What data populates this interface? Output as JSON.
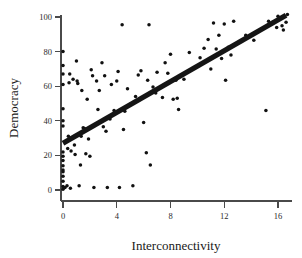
{
  "chart_data": {
    "type": "scatter",
    "title": "",
    "xlabel": "Interconnectivity",
    "ylabel": "Democracy",
    "xlim": [
      -0.8,
      17.2
    ],
    "ylim": [
      -6,
      107
    ],
    "xticks": [
      0,
      4,
      8,
      12,
      16
    ],
    "yticks": [
      0,
      20,
      40,
      60,
      80,
      100
    ],
    "xtick_labels": [
      "0",
      "4",
      "8",
      "12",
      "16"
    ],
    "ytick_labels": [
      "0",
      "20",
      "40",
      "60",
      "80",
      "100"
    ],
    "grid": false,
    "legend": false,
    "point_color": "#111111",
    "line_color": "#151515",
    "axis_color": "#4a4a4a",
    "background": "#ffffff",
    "series": [
      {
        "name": "countries",
        "marker": "filled-circle",
        "points": [
          [
            0.0,
            80.0
          ],
          [
            0.0,
            72.0
          ],
          [
            0.0,
            67.0
          ],
          [
            0.0,
            61.0
          ],
          [
            0.0,
            47.0
          ],
          [
            0.0,
            40.0
          ],
          [
            0.0,
            37.0
          ],
          [
            0.0,
            22.0
          ],
          [
            0.0,
            19.5
          ],
          [
            0.0,
            17.0
          ],
          [
            0.0,
            14.0
          ],
          [
            0.0,
            11.5
          ],
          [
            0.0,
            10.5
          ],
          [
            0.0,
            8.0
          ],
          [
            0.0,
            5.0
          ],
          [
            0.0,
            2.0
          ],
          [
            0.0,
            0.5
          ],
          [
            0.15,
            1.5
          ],
          [
            0.3,
            2.5
          ],
          [
            0.35,
            24.0
          ],
          [
            0.4,
            31.0
          ],
          [
            0.45,
            62.0
          ],
          [
            0.5,
            67.0
          ],
          [
            0.55,
            1.0
          ],
          [
            0.6,
            22.5
          ],
          [
            0.75,
            64.0
          ],
          [
            0.85,
            26.0
          ],
          [
            0.9,
            20.5
          ],
          [
            1.0,
            74.5
          ],
          [
            1.05,
            63.0
          ],
          [
            1.1,
            61.5
          ],
          [
            1.2,
            2.5
          ],
          [
            1.3,
            14.5
          ],
          [
            1.35,
            31.0
          ],
          [
            1.4,
            57.5
          ],
          [
            1.5,
            36.0
          ],
          [
            1.6,
            35.5
          ],
          [
            1.7,
            21.0
          ],
          [
            1.8,
            52.5
          ],
          [
            1.9,
            29.5
          ],
          [
            2.0,
            19.5
          ],
          [
            2.1,
            69.5
          ],
          [
            2.2,
            66.0
          ],
          [
            2.3,
            1.5
          ],
          [
            2.5,
            63.0
          ],
          [
            2.6,
            46.5
          ],
          [
            2.7,
            57.5
          ],
          [
            2.9,
            73.5
          ],
          [
            3.0,
            36.5
          ],
          [
            3.1,
            66.0
          ],
          [
            3.2,
            34.0
          ],
          [
            3.3,
            1.5
          ],
          [
            3.5,
            41.0
          ],
          [
            3.6,
            61.0
          ],
          [
            3.8,
            46.0
          ],
          [
            4.0,
            63.0
          ],
          [
            4.1,
            68.5
          ],
          [
            4.2,
            1.5
          ],
          [
            4.4,
            95.5
          ],
          [
            4.5,
            35.0
          ],
          [
            4.6,
            45.5
          ],
          [
            4.8,
            58.5
          ],
          [
            5.0,
            49.5
          ],
          [
            5.2,
            2.5
          ],
          [
            5.4,
            54.0
          ],
          [
            5.6,
            66.5
          ],
          [
            5.8,
            69.0
          ],
          [
            6.0,
            39.0
          ],
          [
            6.2,
            21.5
          ],
          [
            6.3,
            63.5
          ],
          [
            6.4,
            95.5
          ],
          [
            6.5,
            14.5
          ],
          [
            6.7,
            59.5
          ],
          [
            6.9,
            56.0
          ],
          [
            7.0,
            68.0
          ],
          [
            7.4,
            53.5
          ],
          [
            7.6,
            73.5
          ],
          [
            7.8,
            67.5
          ],
          [
            8.0,
            78.5
          ],
          [
            8.2,
            52.5
          ],
          [
            8.4,
            63.5
          ],
          [
            8.5,
            53.0
          ],
          [
            8.6,
            46.5
          ],
          [
            9.0,
            64.0
          ],
          [
            9.4,
            79.5
          ],
          [
            9.8,
            70.5
          ],
          [
            10.2,
            76.5
          ],
          [
            10.5,
            82.0
          ],
          [
            10.8,
            87.0
          ],
          [
            11.0,
            70.0
          ],
          [
            11.2,
            96.5
          ],
          [
            11.4,
            81.5
          ],
          [
            11.6,
            89.5
          ],
          [
            11.8,
            76.0
          ],
          [
            12.0,
            96.0
          ],
          [
            12.1,
            63.5
          ],
          [
            12.3,
            82.5
          ],
          [
            12.5,
            78.0
          ],
          [
            12.7,
            97.5
          ],
          [
            13.6,
            89.5
          ],
          [
            14.2,
            86.5
          ],
          [
            15.1,
            46.0
          ],
          [
            15.3,
            97.5
          ],
          [
            15.6,
            97.0
          ],
          [
            15.9,
            94.0
          ],
          [
            16.0,
            100.5
          ],
          [
            16.3,
            95.0
          ],
          [
            16.4,
            92.5
          ],
          [
            16.6,
            97.0
          ],
          [
            16.7,
            101.5
          ]
        ]
      }
    ],
    "trendline": {
      "type": "linear-fit",
      "x_start": 0.0,
      "y_start": 27.0,
      "x_end": 16.6,
      "y_end": 101.0
    }
  },
  "axis": {
    "x_title": "Interconnectivity",
    "y_title": "Democracy"
  }
}
